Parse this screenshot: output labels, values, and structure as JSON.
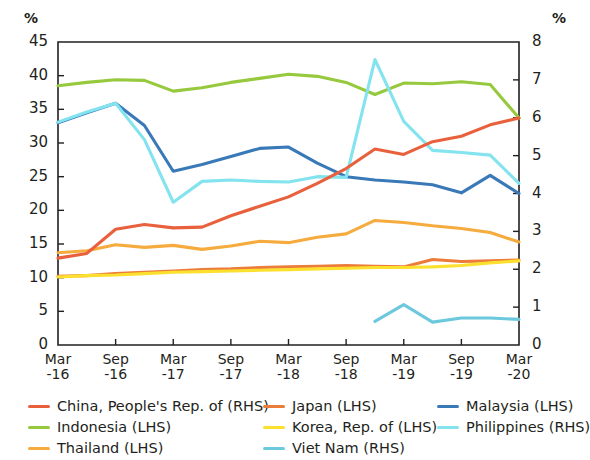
{
  "axes": {
    "left_unit": "%",
    "right_unit": "%",
    "left_ticks": [
      "45",
      "40",
      "35",
      "30",
      "25",
      "20",
      "15",
      "10",
      "5",
      "0"
    ],
    "right_ticks": [
      "8",
      "7",
      "6",
      "5",
      "4",
      "3",
      "2",
      "1",
      "0"
    ],
    "x_ticks": [
      {
        "top": "Mar",
        "bottom": "-16"
      },
      {
        "top": "Sep",
        "bottom": "-16"
      },
      {
        "top": "Mar",
        "bottom": "-17"
      },
      {
        "top": "Sep",
        "bottom": "-17"
      },
      {
        "top": "Mar",
        "bottom": "-18"
      },
      {
        "top": "Sep",
        "bottom": "-18"
      },
      {
        "top": "Mar",
        "bottom": "-19"
      },
      {
        "top": "Sep",
        "bottom": "-19"
      },
      {
        "top": "Mar",
        "bottom": "-20"
      }
    ]
  },
  "legend": {
    "columns": [
      [
        {
          "label": "China, People's Rep. of (RHS)",
          "color": "#e8603c"
        },
        {
          "label": "Indonesia (LHS)",
          "color": "#96c93d"
        },
        {
          "label": "Thailand (LHS)",
          "color": "#f5ab3d"
        }
      ],
      [
        {
          "label": "Japan (LHS)",
          "color": "#ec7c3a"
        },
        {
          "label": "Korea, Rep. of (LHS)",
          "color": "#fbe02e"
        },
        {
          "label": "Viet Nam (RHS)",
          "color": "#6cc9dd"
        }
      ],
      [
        {
          "label": "Malaysia (LHS)",
          "color": "#3a79b8"
        },
        {
          "label": "Philippines (RHS)",
          "color": "#83e3ef"
        }
      ]
    ]
  },
  "chart_data": {
    "type": "line",
    "title": "",
    "xlabel": "",
    "ylabel": "%",
    "y2label": "%",
    "ylim": [
      0,
      45
    ],
    "y2lim": [
      0,
      8
    ],
    "grid": false,
    "legend_position": "bottom",
    "x": [
      "Mar-16",
      "Jun-16",
      "Sep-16",
      "Dec-16",
      "Mar-17",
      "Jun-17",
      "Sep-17",
      "Dec-17",
      "Mar-18",
      "Jun-18",
      "Sep-18",
      "Dec-18",
      "Mar-19",
      "Jun-19",
      "Sep-19",
      "Dec-19",
      "Mar-20"
    ],
    "series": [
      {
        "name": "China, People's Rep. of (RHS)",
        "axis": "right",
        "color": "#e8603c",
        "values_lhs": [
          12.9,
          13.6,
          17.2,
          17.9,
          17.4,
          17.5,
          19.2,
          20.6,
          22.0,
          24.0,
          26.2,
          29.1,
          28.3,
          30.2,
          31.0,
          32.7,
          33.7
        ],
        "values": [
          2.29,
          2.42,
          3.06,
          3.18,
          3.09,
          3.11,
          3.41,
          3.66,
          3.91,
          4.27,
          4.66,
          5.17,
          5.03,
          5.37,
          5.51,
          5.81,
          5.99
        ]
      },
      {
        "name": "Indonesia (LHS)",
        "axis": "left",
        "color": "#96c93d",
        "values": [
          38.5,
          39.0,
          39.4,
          39.3,
          37.7,
          38.2,
          39.0,
          39.6,
          40.2,
          39.9,
          39.0,
          37.2,
          38.9,
          38.8,
          39.1,
          38.7,
          33.7
        ]
      },
      {
        "name": "Thailand (LHS)",
        "axis": "left",
        "color": "#f5ab3d",
        "values": [
          13.7,
          14.0,
          14.9,
          14.5,
          14.8,
          14.2,
          14.7,
          15.4,
          15.2,
          16.0,
          16.5,
          18.5,
          18.2,
          17.7,
          17.3,
          16.7,
          15.3
        ]
      },
      {
        "name": "Japan (LHS)",
        "axis": "left",
        "color": "#ec7c3a",
        "values": [
          10.2,
          10.3,
          10.6,
          10.8,
          11.0,
          11.2,
          11.3,
          11.5,
          11.6,
          11.7,
          11.8,
          11.7,
          11.6,
          12.7,
          12.4,
          12.5,
          12.6
        ]
      },
      {
        "name": "Korea, Rep. of (LHS)",
        "axis": "left",
        "color": "#fbe02e",
        "values": [
          10.1,
          10.3,
          10.4,
          10.6,
          10.8,
          10.9,
          11.0,
          11.1,
          11.2,
          11.3,
          11.4,
          11.5,
          11.5,
          11.6,
          11.8,
          12.2,
          12.5
        ]
      },
      {
        "name": "Viet Nam (RHS)",
        "axis": "right",
        "color": "#6cc9dd",
        "values_lhs": [
          null,
          null,
          null,
          null,
          null,
          null,
          null,
          null,
          null,
          null,
          null,
          3.5,
          6.0,
          3.4,
          4.0,
          4.0,
          3.8
        ],
        "values": [
          null,
          null,
          null,
          null,
          null,
          null,
          null,
          null,
          null,
          null,
          null,
          0.62,
          1.07,
          0.6,
          0.71,
          0.71,
          0.68
        ]
      },
      {
        "name": "Malaysia (LHS)",
        "axis": "left",
        "color": "#3a79b8",
        "values": [
          33.0,
          34.5,
          35.9,
          32.6,
          25.8,
          26.8,
          28.0,
          29.2,
          29.4,
          27.0,
          25.0,
          24.5,
          24.2,
          23.8,
          22.6,
          25.2,
          22.5
        ]
      },
      {
        "name": "Philippines (RHS)",
        "axis": "right",
        "color": "#83e3ef",
        "values_lhs": [
          33.1,
          34.6,
          35.9,
          30.5,
          21.2,
          24.3,
          24.5,
          24.3,
          24.2,
          25.0,
          24.9,
          42.4,
          33.2,
          28.9,
          28.6,
          28.2,
          24.0
        ],
        "values": [
          5.88,
          6.15,
          6.38,
          5.42,
          3.77,
          4.32,
          4.36,
          4.32,
          4.3,
          4.44,
          4.43,
          7.54,
          5.9,
          5.14,
          5.08,
          5.01,
          4.27
        ]
      }
    ]
  }
}
